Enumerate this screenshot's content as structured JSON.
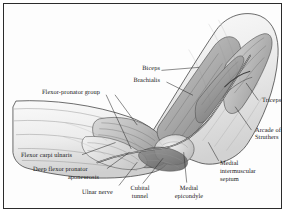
{
  "figure": {
    "style": "grayscale medical line-and-wash illustration",
    "frame_color": "#2b2b2b",
    "background_color": "#fdfdfd",
    "ink_color": "#1a1a1a"
  },
  "labels": {
    "biceps": "Biceps",
    "brachialis": "Brachialis",
    "flexor_pronator_group": "Flexor-pronator group",
    "triceps": "Triceps",
    "arcade_of_struthers_line1": "Arcade of",
    "arcade_of_struthers_line2": "Struthers",
    "flexor_carpi_ulnaris": "Flexor carpi ulnaris",
    "deep_flexor_pronator_line1": "Deep flexor pronator",
    "deep_flexor_pronator_line2": "aponeurosis",
    "ulnar_nerve": "Ulnar nerve",
    "cubital_tunnel_line1": "Cubital",
    "cubital_tunnel_line2": "tunnel",
    "medial_epicondyle_line1": "Medial",
    "medial_epicondyle_line2": "epicondyle",
    "medial_intermuscular_septum_line1": "Medial",
    "medial_intermuscular_septum_line2": "intermuscular",
    "medial_intermuscular_septum_line3": "septum"
  }
}
